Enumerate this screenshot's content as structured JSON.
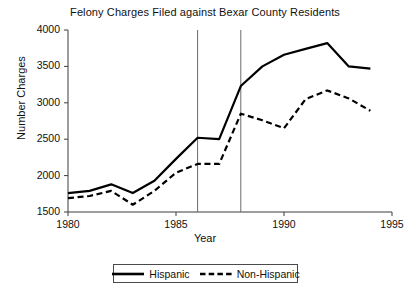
{
  "chart_data": {
    "type": "line",
    "title": "Felony Charges Filed against Bexar County Residents",
    "xlabel": "Year",
    "ylabel": "Number Charges",
    "xlim": [
      1980,
      1995
    ],
    "ylim": [
      1500,
      4000
    ],
    "ytick_labels": [
      "4000",
      "3500",
      "3000",
      "2500",
      "2000",
      "1500"
    ],
    "ytick_values": [
      4000,
      3500,
      3000,
      2500,
      2000,
      1500
    ],
    "xtick_labels": [
      "1980",
      "1985",
      "1990",
      "1995"
    ],
    "xtick_values": [
      1980,
      1985,
      1990,
      1995
    ],
    "grid": false,
    "legend_position": "below-center",
    "x": [
      1980,
      1981,
      1982,
      1983,
      1984,
      1985,
      1986,
      1987,
      1988,
      1989,
      1990,
      1991,
      1992,
      1993,
      1994
    ],
    "series": [
      {
        "name": "Hispanic",
        "style": "solid",
        "color": "#000000",
        "values": [
          1760,
          1790,
          1880,
          1760,
          1930,
          2230,
          2520,
          2500,
          3230,
          3500,
          3660,
          3740,
          3820,
          3500,
          3470
        ]
      },
      {
        "name": "Non-Hispanic",
        "style": "dashed",
        "color": "#000000",
        "values": [
          1690,
          1720,
          1790,
          1600,
          1790,
          2040,
          2160,
          2160,
          2850,
          2760,
          2650,
          3050,
          3170,
          3060,
          2890
        ]
      }
    ],
    "annotations": [
      {
        "type": "vline",
        "x": 1986,
        "label": ""
      },
      {
        "type": "vline",
        "x": 1988,
        "label": ""
      }
    ]
  },
  "legend": {
    "entries": [
      {
        "label": "Hispanic",
        "style": "solid"
      },
      {
        "label": "Non-Hispanic",
        "style": "dashed"
      }
    ]
  }
}
